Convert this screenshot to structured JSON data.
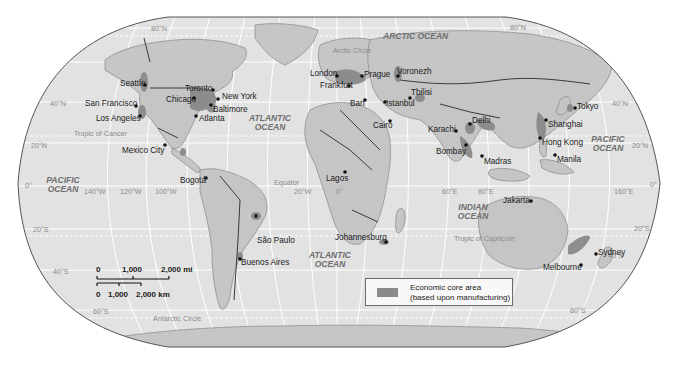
{
  "map": {
    "title": "World economic core areas",
    "projection": "Robinson",
    "colors": {
      "ocean": "#e2e2e2",
      "land": "#c4c4c4",
      "core_area": "#8a8a8a",
      "border": "#3a3a3a",
      "graticule": "#ffffff",
      "outline": "#555555"
    }
  },
  "oceans": [
    {
      "name": "arctic",
      "label": "ARCTIC OCEAN"
    },
    {
      "name": "atlantic-north",
      "label": "ATLANTIC OCEAN"
    },
    {
      "name": "atlantic-south",
      "label": "ATLANTIC OCEAN"
    },
    {
      "name": "pacific-west",
      "label": "PACIFIC OCEAN"
    },
    {
      "name": "pacific-east",
      "label": "PACIFIC OCEAN"
    },
    {
      "name": "indian",
      "label": "INDIAN OCEAN"
    }
  ],
  "special_lines": {
    "arctic_circle": "Arctic Circle",
    "tropic_cancer": "Tropic of Cancer",
    "equator": "Equator",
    "tropic_capricorn": "Tropic of Capricorn",
    "antarctic_circle": "Antarctic Circle"
  },
  "graticule_labels": {
    "lat_80n_left": "80°N",
    "lat_80n_right": "80°N",
    "lat_40n_left": "40°N",
    "lat_40n_right": "40°N",
    "lat_20n_left": "20°N",
    "lat_20n_right": "20°N",
    "lat_0_left": "0°",
    "lat_0_right": "0°",
    "lat_20s_left": "20°S",
    "lat_20s_right": "20°S",
    "lat_40s_left": "40°S",
    "lat_40s_right": "40°S",
    "lat_60s_left": "60°S",
    "lat_60s_right": "60°S",
    "lon_140w": "140°W",
    "lon_120w": "120°W",
    "lon_100w": "100°W",
    "lon_20w": "20°W",
    "lon_0": "0°",
    "lon_60e": "60°E",
    "lon_80e": "80°E",
    "lon_160e": "160°E"
  },
  "cities": [
    {
      "name": "Seattle"
    },
    {
      "name": "San Francisco"
    },
    {
      "name": "Los Angeles"
    },
    {
      "name": "Toronto"
    },
    {
      "name": "Chicago"
    },
    {
      "name": "New York"
    },
    {
      "name": "Baltimore"
    },
    {
      "name": "Atlanta"
    },
    {
      "name": "Mexico City"
    },
    {
      "name": "Bogotá"
    },
    {
      "name": "São Paulo"
    },
    {
      "name": "Buenos Aires"
    },
    {
      "name": "London"
    },
    {
      "name": "Frankfurt"
    },
    {
      "name": "Prague"
    },
    {
      "name": "Voronezh"
    },
    {
      "name": "Bari"
    },
    {
      "name": "Istanbul"
    },
    {
      "name": "Tbilisi"
    },
    {
      "name": "Cairo"
    },
    {
      "name": "Lagos"
    },
    {
      "name": "Johannesburg"
    },
    {
      "name": "Karachi"
    },
    {
      "name": "Delhi"
    },
    {
      "name": "Bombay"
    },
    {
      "name": "Madras"
    },
    {
      "name": "Shanghai"
    },
    {
      "name": "Tokyo"
    },
    {
      "name": "Hong Kong"
    },
    {
      "name": "Manila"
    },
    {
      "name": "Jakarta"
    },
    {
      "name": "Sydney"
    },
    {
      "name": "Melbourne"
    }
  ],
  "scale_bar": {
    "miles": {
      "ticks": [
        "0",
        "1,000",
        "2,000 mi"
      ]
    },
    "km": {
      "ticks": [
        "0",
        "1,000",
        "2,000 km"
      ]
    }
  },
  "legend": {
    "items": [
      {
        "label_line1": "Economic core area",
        "label_line2": "(based upon manufacturing)",
        "color": "#8a8a8a"
      }
    ]
  }
}
